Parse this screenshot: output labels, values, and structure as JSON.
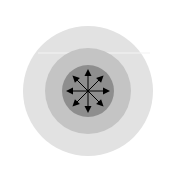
{
  "diagram": {
    "type": "concentric-circles-with-radial-arrows",
    "colors": {
      "background": "#ffffff",
      "outer_circle": "#e2e2e2",
      "middle_circle": "#c4c4c4",
      "inner_circle": "#8e8e8e",
      "arrows": "#000000",
      "highlight_line": "#f4f4f4"
    },
    "center": [
      88,
      91
    ],
    "radii": {
      "outer": 65,
      "middle": 43,
      "inner": 26
    },
    "arrow_length": 22,
    "arrow_directions_deg": [
      0,
      45,
      90,
      135,
      180,
      225,
      270,
      315
    ],
    "icon": "expand-all-directions-icon"
  }
}
